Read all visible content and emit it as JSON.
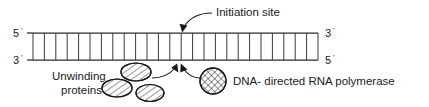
{
  "figure": {
    "background_color": "#ffffff",
    "ink_color": "#1a1a1a"
  },
  "callouts": {
    "initiation_site": "Initiation site",
    "unwinding_proteins_line1": "Unwinding",
    "unwinding_proteins_line2": "proteins",
    "polymerase": "DNA- directed RNA polymerase"
  },
  "strand_labels": {
    "top_left": "5",
    "bottom_left": "3",
    "top_right": "3",
    "bottom_right": "5",
    "prime_mark": "'"
  },
  "diagram_data": {
    "type": "diagram",
    "subject": "DNA double helix schematic with RNA polymerase and unwinding proteins",
    "ladder": {
      "x_start": 33,
      "x_end": 318,
      "y_top": 33,
      "y_bottom": 60,
      "rung_count": 25
    },
    "initiation_site_x": 185,
    "unwinding_proteins_count": 3,
    "polymerase_count": 1,
    "arrows": [
      {
        "name": "initiation-site-leader",
        "from": "label",
        "to": "top strand"
      },
      {
        "name": "unwinding-protein-pointer",
        "from": "ellipse",
        "to": "bottom strand"
      },
      {
        "name": "polymerase-pointer",
        "from": "circle",
        "to": "bottom strand"
      }
    ]
  }
}
